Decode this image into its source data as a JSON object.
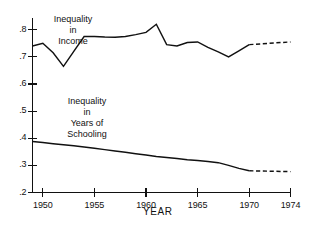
{
  "chart_data": {
    "type": "line",
    "title": "",
    "subtitle": "",
    "xlabel": "YEAR",
    "ylabel": "",
    "xlim": [
      1949,
      1974
    ],
    "ylim": [
      0.2,
      0.845
    ],
    "grid": false,
    "legend_position": "inline-annotation",
    "x_ticks": [
      1950,
      1955,
      1960,
      1965,
      1970,
      1974
    ],
    "x_tick_labels": [
      "1950",
      "1955",
      "1960",
      "1965",
      "1970",
      "1974"
    ],
    "y_ticks": [
      0.2,
      0.3,
      0.4,
      0.5,
      0.6,
      0.7,
      0.8
    ],
    "y_tick_labels": [
      ".2",
      ".3",
      ".4",
      ".5",
      ".6",
      ".7",
      ".8"
    ],
    "series": [
      {
        "name": "Inequality in Income",
        "label_lines": [
          "Inequality",
          "in",
          "Income"
        ],
        "style": "solid",
        "x": [
          1949,
          1950,
          1951,
          1952,
          1953,
          1954,
          1955,
          1956,
          1957,
          1958,
          1959,
          1960,
          1961,
          1962,
          1963,
          1964,
          1965,
          1966,
          1967,
          1968,
          1969,
          1970
        ],
        "values": [
          0.74,
          0.75,
          0.715,
          0.665,
          0.72,
          0.775,
          0.775,
          0.773,
          0.772,
          0.775,
          0.782,
          0.79,
          0.82,
          0.745,
          0.74,
          0.753,
          0.755,
          0.735,
          0.718,
          0.7,
          0.722,
          0.745
        ],
        "projection_style": "dashed",
        "projection_x": [
          1970,
          1974
        ],
        "projection_values": [
          0.745,
          0.755
        ]
      },
      {
        "name": "Inequality in Years of Schooling",
        "label_lines": [
          "Inequality",
          "in",
          "Years of",
          "Schooling"
        ],
        "style": "solid",
        "x": [
          1949,
          1950,
          1951,
          1952,
          1953,
          1954,
          1955,
          1956,
          1957,
          1958,
          1959,
          1960,
          1961,
          1962,
          1963,
          1964,
          1965,
          1966,
          1967,
          1968,
          1969,
          1970
        ],
        "values": [
          0.388,
          0.384,
          0.38,
          0.376,
          0.372,
          0.368,
          0.363,
          0.358,
          0.353,
          0.348,
          0.343,
          0.338,
          0.333,
          0.329,
          0.325,
          0.321,
          0.318,
          0.314,
          0.31,
          0.3,
          0.289,
          0.28
        ],
        "projection_style": "dashed",
        "projection_x": [
          1970,
          1974
        ],
        "projection_values": [
          0.28,
          0.277
        ]
      }
    ]
  },
  "axis_titles": {
    "x": "YEAR"
  }
}
